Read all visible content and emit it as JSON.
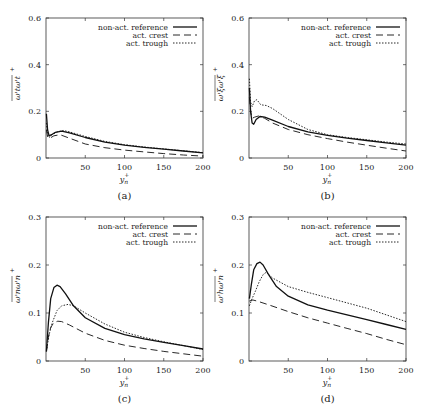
{
  "figure": {
    "legend": [
      "non-act. reference",
      "act. crest",
      "act. trough"
    ],
    "xlabel": "y",
    "xlabel_sub": "n",
    "xlabel_sup": "+"
  },
  "chart_data": [
    {
      "id": "a",
      "type": "line",
      "caption": "(a)",
      "ylabel": "ω'_t ω'_t +",
      "ylabel_main": "ω'tω't",
      "xlabel": "y_n^+",
      "xlim": [
        0,
        200
      ],
      "ylim": [
        0,
        0.6
      ],
      "xticks": [
        50,
        100,
        150,
        200
      ],
      "yticks": [
        0,
        0.2,
        0.4,
        0.6
      ],
      "ytick_labels": [
        "0",
        "0.2",
        "0.4",
        "0.6"
      ],
      "legend_position": "top-right",
      "grid": false,
      "series": [
        {
          "name": "non-act. reference",
          "style": "solid",
          "x": [
            0.5,
            2,
            4,
            7,
            12,
            20,
            30,
            50,
            75,
            100,
            125,
            150,
            175,
            200
          ],
          "y": [
            0.19,
            0.12,
            0.095,
            0.1,
            0.11,
            0.115,
            0.108,
            0.088,
            0.068,
            0.055,
            0.046,
            0.038,
            0.03,
            0.022
          ]
        },
        {
          "name": "act. crest",
          "style": "dashed",
          "x": [
            0.5,
            2,
            5,
            10,
            18,
            30,
            50,
            75,
            100,
            125,
            150,
            175,
            200
          ],
          "y": [
            0.12,
            0.09,
            0.085,
            0.095,
            0.1,
            0.085,
            0.06,
            0.044,
            0.034,
            0.026,
            0.019,
            0.013,
            0.008
          ]
        },
        {
          "name": "act. trough",
          "style": "dotted",
          "x": [
            0.5,
            2,
            4,
            8,
            14,
            22,
            30,
            50,
            75,
            100,
            125,
            150,
            175,
            200
          ],
          "y": [
            0.15,
            0.1,
            0.088,
            0.1,
            0.112,
            0.118,
            0.112,
            0.092,
            0.071,
            0.057,
            0.047,
            0.039,
            0.031,
            0.023
          ]
        }
      ]
    },
    {
      "id": "b",
      "type": "line",
      "caption": "(b)",
      "ylabel": "ω'_ξ ω'_ξ +",
      "ylabel_main": "ω'ξω'ξ",
      "xlabel": "y_n^+",
      "xlim": [
        0,
        200
      ],
      "ylim": [
        0,
        0.6
      ],
      "xticks": [
        50,
        100,
        150,
        200
      ],
      "yticks": [
        0,
        0.2,
        0.4,
        0.6
      ],
      "ytick_labels": [
        "0",
        "0.2",
        "0.4",
        "0.6"
      ],
      "legend_position": "top-right",
      "grid": false,
      "series": [
        {
          "name": "non-act. reference",
          "style": "solid",
          "x": [
            0.5,
            2,
            4,
            6,
            9,
            14,
            20,
            30,
            50,
            75,
            100,
            125,
            150,
            175,
            200
          ],
          "y": [
            0.3,
            0.2,
            0.15,
            0.145,
            0.165,
            0.178,
            0.175,
            0.162,
            0.135,
            0.112,
            0.097,
            0.085,
            0.075,
            0.065,
            0.055
          ]
        },
        {
          "name": "act. crest",
          "style": "dashed",
          "x": [
            0.5,
            2,
            4,
            7,
            12,
            20,
            30,
            50,
            75,
            100,
            125,
            150,
            175,
            200
          ],
          "y": [
            0.26,
            0.2,
            0.17,
            0.175,
            0.18,
            0.17,
            0.15,
            0.122,
            0.1,
            0.083,
            0.068,
            0.055,
            0.042,
            0.03
          ]
        },
        {
          "name": "act. trough",
          "style": "dotted",
          "x": [
            0.5,
            2,
            4,
            7,
            10,
            15,
            22,
            30,
            50,
            75,
            100,
            125,
            150,
            175,
            200
          ],
          "y": [
            0.34,
            0.24,
            0.22,
            0.245,
            0.25,
            0.228,
            0.225,
            0.212,
            0.165,
            0.122,
            0.1,
            0.088,
            0.078,
            0.068,
            0.06
          ]
        }
      ]
    },
    {
      "id": "c",
      "type": "line",
      "caption": "(c)",
      "ylabel": "ω'_n ω'_n +",
      "ylabel_main": "ω'nω'n",
      "xlabel": "y_n^+",
      "xlim": [
        0,
        200
      ],
      "ylim": [
        0,
        0.3
      ],
      "xticks": [
        50,
        100,
        150,
        200
      ],
      "yticks": [
        0,
        0.1,
        0.2,
        0.3
      ],
      "ytick_labels": [
        "0",
        "0.1",
        "0.2",
        "0.3"
      ],
      "legend_position": "top-right",
      "grid": false,
      "series": [
        {
          "name": "non-act. reference",
          "style": "solid",
          "x": [
            0.5,
            3,
            6,
            10,
            14,
            18,
            25,
            35,
            50,
            75,
            100,
            125,
            150,
            175,
            200
          ],
          "y": [
            0.02,
            0.08,
            0.13,
            0.153,
            0.158,
            0.155,
            0.14,
            0.115,
            0.09,
            0.068,
            0.055,
            0.046,
            0.039,
            0.032,
            0.025
          ]
        },
        {
          "name": "act. crest",
          "style": "dashed",
          "x": [
            0.5,
            3,
            6,
            10,
            15,
            20,
            30,
            50,
            75,
            100,
            125,
            150,
            175,
            200
          ],
          "y": [
            0.02,
            0.05,
            0.07,
            0.08,
            0.083,
            0.082,
            0.075,
            0.058,
            0.043,
            0.033,
            0.026,
            0.02,
            0.015,
            0.01
          ]
        },
        {
          "name": "act. trough",
          "style": "dotted",
          "x": [
            0.5,
            4,
            8,
            14,
            20,
            28,
            35,
            50,
            75,
            100,
            125,
            150,
            175,
            200
          ],
          "y": [
            0.02,
            0.055,
            0.08,
            0.105,
            0.115,
            0.118,
            0.115,
            0.1,
            0.077,
            0.06,
            0.049,
            0.04,
            0.032,
            0.024
          ]
        }
      ]
    },
    {
      "id": "d",
      "type": "line",
      "caption": "(d)",
      "ylabel": "ω'_h ω'_n +",
      "ylabel_main": "ω'hω'n",
      "xlabel": "y_n^+",
      "xlim": [
        0,
        200
      ],
      "ylim": [
        0,
        0.3
      ],
      "xticks": [
        50,
        100,
        150,
        200
      ],
      "yticks": [
        0,
        0.1,
        0.2,
        0.3
      ],
      "ytick_labels": [
        "0",
        "0.1",
        "0.2",
        "0.3"
      ],
      "legend_position": "top-right",
      "grid": false,
      "series": [
        {
          "name": "non-act. reference",
          "style": "solid",
          "x": [
            0.5,
            3,
            6,
            10,
            14,
            18,
            25,
            35,
            50,
            75,
            100,
            125,
            150,
            175,
            200
          ],
          "y": [
            0.13,
            0.16,
            0.19,
            0.203,
            0.206,
            0.2,
            0.18,
            0.155,
            0.135,
            0.117,
            0.106,
            0.096,
            0.086,
            0.076,
            0.066
          ]
        },
        {
          "name": "act. crest",
          "style": "dashed",
          "x": [
            0.5,
            5,
            10,
            25,
            50,
            75,
            100,
            125,
            150,
            175,
            200
          ],
          "y": [
            0.125,
            0.127,
            0.125,
            0.117,
            0.103,
            0.09,
            0.079,
            0.068,
            0.057,
            0.045,
            0.034
          ]
        },
        {
          "name": "act. trough",
          "style": "dotted",
          "x": [
            0.5,
            4,
            8,
            13,
            18,
            22,
            30,
            50,
            75,
            100,
            125,
            150,
            175,
            200
          ],
          "y": [
            0.115,
            0.13,
            0.145,
            0.165,
            0.18,
            0.185,
            0.173,
            0.155,
            0.143,
            0.132,
            0.121,
            0.11,
            0.096,
            0.082
          ]
        }
      ]
    }
  ]
}
